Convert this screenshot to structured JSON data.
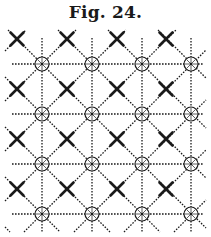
{
  "figure": {
    "title": "Fig. 24.",
    "ink_color": "#1a1a1a",
    "grid": {
      "columns_x": [
        42,
        92,
        142,
        191
      ],
      "rows_y": [
        64,
        114,
        164,
        214
      ],
      "cross_offset": 25,
      "top_y": 38,
      "left_x": 12,
      "right_x": 203,
      "bottom_y": 232
    },
    "markers": {
      "circle_nodes": "circle-with-spokes at each grid intersection",
      "cross_nodes": "bold X at each diagonal cell center"
    }
  }
}
